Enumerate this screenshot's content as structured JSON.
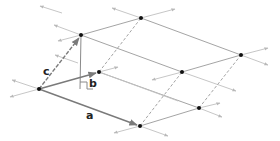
{
  "diagram": {
    "colors": {
      "edge": "#9a9a9a",
      "vector": "#8a8a8a",
      "extension": "#b8b8b8",
      "point": "#111111",
      "label": "#222222"
    },
    "labels": {
      "a": "a",
      "b": "b",
      "c": "c"
    },
    "points": {
      "O": [
        39,
        89
      ],
      "A": [
        140,
        126
      ],
      "B": [
        99,
        72
      ],
      "C": [
        81,
        35
      ],
      "AB": [
        199,
        108
      ],
      "AC": [
        182,
        72
      ],
      "BC": [
        141,
        18
      ],
      "ABC": [
        241,
        55
      ],
      "foot": [
        80,
        89
      ]
    },
    "vectors": [
      {
        "name": "a",
        "from": "O",
        "to": "A"
      },
      {
        "name": "b",
        "from": "O",
        "to": "B"
      },
      {
        "name": "c",
        "from": "O",
        "to": "C"
      }
    ],
    "height_marker": {
      "from": "C",
      "to": "foot",
      "right_angle": true
    }
  }
}
